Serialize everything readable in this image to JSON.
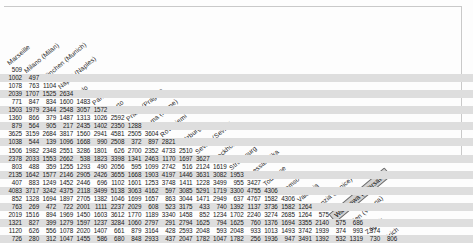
{
  "document": {
    "title": "European intercity road distance matrix",
    "type": "lower-triangular-distance-matrix"
  },
  "selection": {
    "highlighted_header": "Warszawa ( Warsaw)"
  },
  "chart_data": {
    "type": "table",
    "xlabel": "",
    "ylabel": "",
    "grid": false,
    "legend": "none",
    "categories": [
      "Marseille",
      "Milano (Milan)",
      "München (Munich)",
      "Napoli (Naples)",
      "Oslo",
      "Paris",
      "Porto",
      "Praha (Prague)",
      "Roma (Rome)",
      "Rovaniemi",
      "Salzburg",
      "Sevilla (Seville)",
      "Stockholm",
      "Strasbourg",
      "Thessalonika",
      "Toulouse",
      "Tromso",
      "Valencia",
      "Venzia (Venice)",
      "Warszawa ( Warsaw)",
      "Wien (Vienna)",
      "Zagreb",
      "Zürich"
    ],
    "rows": [
      [
        509
      ],
      [
        1002,
        497
      ],
      [
        1078,
        763,
        1104
      ],
      [
        2039,
        1707,
        1525,
        2634
      ],
      [
        771,
        847,
        834,
        1600,
        1483
      ],
      [
        1503,
        1979,
        2344,
        2548,
        3057,
        1572
      ],
      [
        1360,
        866,
        379,
        1487,
        1313,
        1026,
        2592
      ],
      [
        879,
        564,
        905,
        217,
        2435,
        1402,
        2350,
        1288
      ],
      [
        3625,
        3159,
        2684,
        3817,
        1560,
        2941,
        4581,
        2505,
        3604
      ],
      [
        1038,
        544,
        139,
        1096,
        1668,
        990,
        2508,
        372,
        897,
        2821
      ],
      [
        1506,
        1982,
        2348,
        2551,
        3286,
        1801,
        626,
        2700,
        2352,
        4733,
        2510
      ],
      [
        2378,
        2033,
        1553,
        2662,
        538,
        1823,
        3398,
        1341,
        2463,
        1170,
        1697,
        3627
      ],
      [
        803,
        488,
        359,
        1255,
        1293,
        490,
        2056,
        595,
        1099,
        2742,
        516,
        2124,
        1619
      ],
      [
        2135,
        1642,
        1577,
        2146,
        2905,
        2426,
        3655,
        1668,
        1903,
        4197,
        1446,
        3631,
        3082,
        1953
      ],
      [
        407,
        883,
        1249,
        1452,
        2446,
        696,
        1102,
        1601,
        1253,
        3748,
        1411,
        1228,
        3499,
        955,
        3427
      ],
      [
        4083,
        3717,
        3242,
        4375,
        2118,
        3499,
        5138,
        3063,
        4162,
        597,
        3085,
        5291,
        1719,
        3300,
        4755,
        4306
      ],
      [
        852,
        1328,
        1694,
        1897,
        2705,
        1382,
        1046,
        1699,
        1657,
        863,
        3044,
        1471,
        2949,
        637,
        4767,
        1582,
        4306
      ],
      [
        763,
        269,
        472,
        722,
        2001,
        1111,
        2237,
        2029,
        608,
        523,
        3175,
        433,
        740,
        1392,
        1137,
        3736,
        1582,
        1264
      ],
      [
        2019,
        1516,
        894,
        1969,
        1450,
        1603,
        3612,
        1770,
        1189,
        3340,
        1458,
        852,
        1234,
        1702,
        2240,
        3274,
        2685,
        1264,
        575
      ],
      [
        1321,
        827,
        399,
        1279,
        1597,
        1237,
        3284,
        1060,
        2797,
        291,
        2794,
        1625,
        794,
        1625,
        760,
        1376,
        1694,
        3355,
        2140,
        575,
        686
      ],
      [
        1120,
        626,
        556,
        1078,
        2020,
        1407,
        661,
        879,
        3164,
        428,
        2593,
        2048,
        593,
        2048,
        933,
        1013,
        1493,
        3742,
        1939,
        374,
        993,
        374
      ],
      [
        726,
        280,
        312,
        1047,
        1455,
        586,
        680,
        848,
        2933,
        437,
        2047,
        1782,
        1047,
        1782,
        256,
        1936,
        947,
        3491,
        1392,
        532,
        1319,
        730,
        806
      ]
    ]
  }
}
